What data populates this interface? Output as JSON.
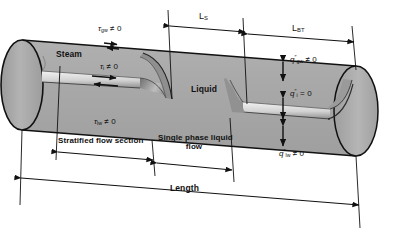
{
  "figure": {
    "type": "engineering-schematic",
    "pipe": {
      "fill_color": "#a8a8a8",
      "outline_color": "#111111",
      "void_highlight_color": "#e9e9e9"
    }
  },
  "regions": {
    "steam_label": "Steam",
    "liquid_label": "Liquid"
  },
  "shear_labels": {
    "gas_wall": {
      "symbol": "τ",
      "subscript": "gw",
      "relation": "≠ 0"
    },
    "interface": {
      "symbol": "τ",
      "subscript": "i",
      "relation": "≠ 0"
    },
    "liquid_wall": {
      "symbol": "τ",
      "subscript": "lw",
      "relation": "≠ 0"
    }
  },
  "heat_flux_labels": {
    "gas_wall": {
      "symbol": "q",
      "prime": "″",
      "subscript": "gw",
      "relation": "≠ 0"
    },
    "interface": {
      "symbol": "q",
      "prime": "″",
      "subscript": "i",
      "relation": "= 0"
    },
    "liquid_wall": {
      "symbol": "q",
      "prime": "″",
      "subscript": "lw",
      "relation": "≠ 0"
    }
  },
  "dimensions": {
    "l_s": {
      "symbol": "L",
      "subscript": "S"
    },
    "l_bt": {
      "symbol": "L",
      "subscript": "BT"
    },
    "stratified": "Stratified flow section",
    "single_phase_line1": "Single phase liquid",
    "single_phase_line2": "flow",
    "length": "Length"
  }
}
